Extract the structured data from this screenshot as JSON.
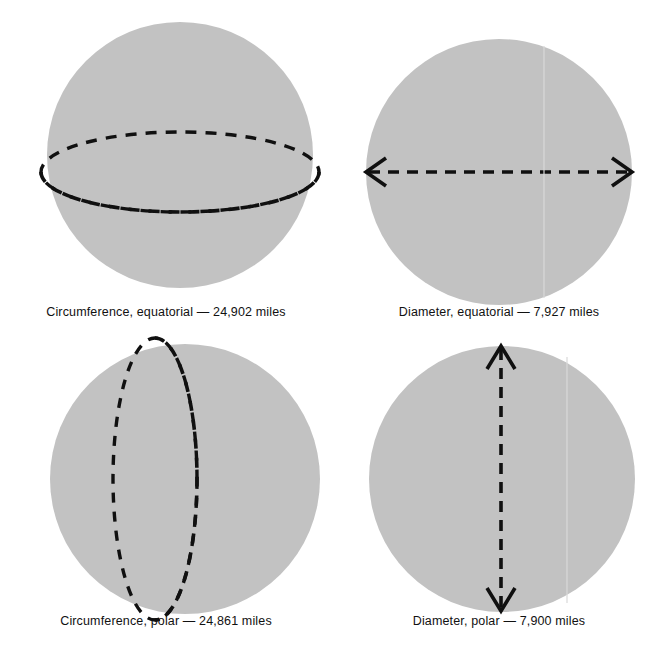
{
  "figure": {
    "background_color": "#ffffff",
    "sphere_fill_color": "#c2c2c2",
    "line_color": "#101010",
    "text_color": "#111111"
  },
  "panels": [
    {
      "id": "circumference-equatorial",
      "caption": "Circumference, equatorial — 24,902 miles",
      "measure": "Circumference",
      "orientation": "equatorial",
      "value": "24,902",
      "unit": "miles",
      "overlay": "horizontal-dashed-ellipse"
    },
    {
      "id": "diameter-equatorial",
      "caption": "Diameter, equatorial — 7,927 miles",
      "measure": "Diameter",
      "orientation": "equatorial",
      "value": "7,927",
      "unit": "miles",
      "overlay": "horizontal-double-arrow"
    },
    {
      "id": "circumference-polar",
      "caption": "Circumference, polar — 24,861 miles",
      "measure": "Circumference",
      "orientation": "polar",
      "value": "24,861",
      "unit": "miles",
      "overlay": "vertical-dashed-ellipse"
    },
    {
      "id": "diameter-polar",
      "caption": "Diameter, polar — 7,900 miles",
      "measure": "Diameter",
      "orientation": "polar",
      "value": "7,900",
      "unit": "miles",
      "overlay": "vertical-double-arrow"
    }
  ]
}
